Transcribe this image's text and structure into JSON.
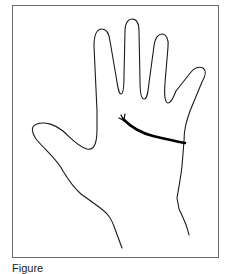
{
  "figure": {
    "colors": {
      "frame": "#6a6a6a",
      "outline": "#1a1a1a",
      "heart_line": "#000000",
      "background": "#ffffff"
    },
    "caption": "Figure"
  }
}
